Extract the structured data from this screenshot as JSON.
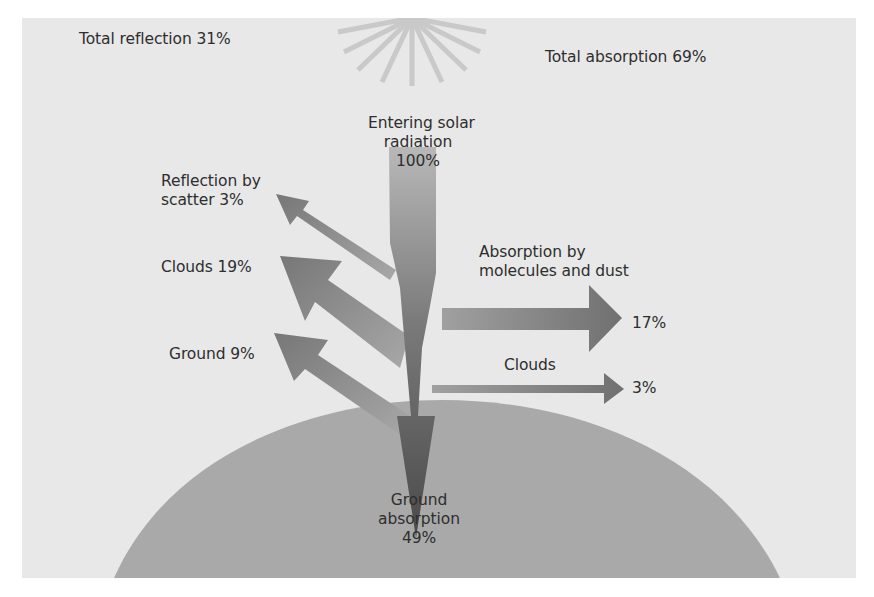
{
  "colors": {
    "background": "#e8e8e8",
    "earth": "#a9a9a9",
    "main_arrow_top": "#b5b5b5",
    "main_arrow_bottom": "#4e4e4e",
    "side_arrows": "#8a8a8a",
    "text": "#2e2e2e"
  },
  "totals": {
    "reflection": "Total reflection 31%",
    "absorption": "Total absorption 69%"
  },
  "incoming": {
    "line1": "Entering solar",
    "line2": "radiation",
    "value": "100%"
  },
  "reflection": {
    "scatter_line1": "Reflection by",
    "scatter_line2": "scatter 3%",
    "clouds": "Clouds 19%",
    "ground": "Ground 9%"
  },
  "absorption": {
    "molecules_line1": "Absorption by",
    "molecules_line2": "molecules and dust",
    "molecules_value": "17%",
    "clouds_label": "Clouds",
    "clouds_value": "3%",
    "ground_line1": "Ground",
    "ground_line2": "absorption",
    "ground_value": "49%"
  },
  "flows": [
    {
      "name": "Entering solar radiation",
      "value": 100
    },
    {
      "name": "Reflection by scatter",
      "value": 3
    },
    {
      "name": "Reflection by clouds",
      "value": 19
    },
    {
      "name": "Reflection by ground",
      "value": 9
    },
    {
      "name": "Absorption by molecules and dust",
      "value": 17
    },
    {
      "name": "Absorption by clouds",
      "value": 3
    },
    {
      "name": "Ground absorption",
      "value": 49
    }
  ]
}
